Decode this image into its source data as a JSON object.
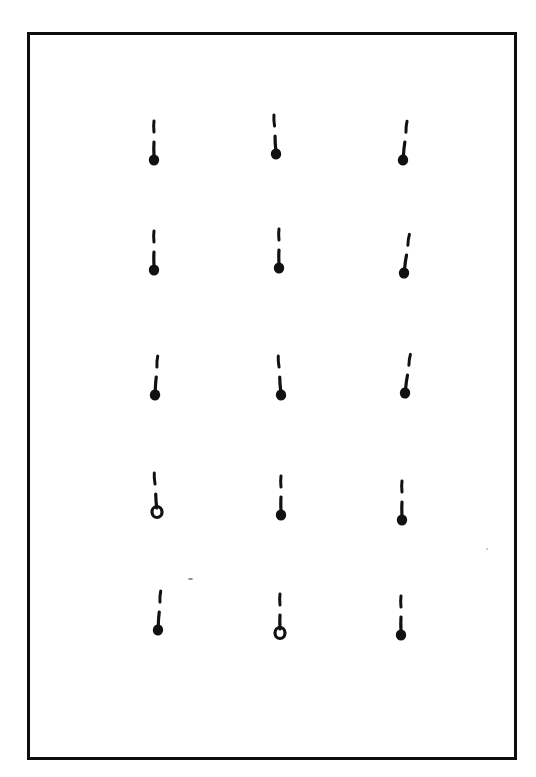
{
  "figure": {
    "frame": {
      "left": 27,
      "top": 32,
      "right": 514,
      "bottom": 757,
      "stroke_color": "#111111"
    },
    "ink_color": "#111111",
    "background": "#ffffff",
    "grid": {
      "columns": 3,
      "rows": 5,
      "column_x": [
        154,
        277,
        402
      ],
      "row_y": [
        120,
        230,
        352,
        472,
        590
      ]
    },
    "marks": [
      {
        "row": 0,
        "col": 0,
        "x": 154,
        "y": 120,
        "tilt": 0,
        "blob": "filled"
      },
      {
        "row": 0,
        "col": 1,
        "x": 276,
        "y": 114,
        "tilt": -3,
        "blob": "filled"
      },
      {
        "row": 0,
        "col": 2,
        "x": 403,
        "y": 120,
        "tilt": 6,
        "blob": "filled"
      },
      {
        "row": 1,
        "col": 0,
        "x": 154,
        "y": 230,
        "tilt": 0,
        "blob": "filled"
      },
      {
        "row": 1,
        "col": 1,
        "x": 279,
        "y": 228,
        "tilt": 0,
        "blob": "filled"
      },
      {
        "row": 1,
        "col": 2,
        "x": 404,
        "y": 233,
        "tilt": 8,
        "blob": "filled"
      },
      {
        "row": 2,
        "col": 0,
        "x": 155,
        "y": 355,
        "tilt": 4,
        "blob": "filled"
      },
      {
        "row": 2,
        "col": 1,
        "x": 281,
        "y": 355,
        "tilt": -4,
        "blob": "filled"
      },
      {
        "row": 2,
        "col": 2,
        "x": 405,
        "y": 353,
        "tilt": 8,
        "blob": "filled"
      },
      {
        "row": 3,
        "col": 0,
        "x": 157,
        "y": 472,
        "tilt": -4,
        "blob": "ring"
      },
      {
        "row": 3,
        "col": 1,
        "x": 281,
        "y": 475,
        "tilt": 0,
        "blob": "filled"
      },
      {
        "row": 3,
        "col": 2,
        "x": 402,
        "y": 480,
        "tilt": 0,
        "blob": "filled"
      },
      {
        "row": 4,
        "col": 0,
        "x": 158,
        "y": 590,
        "tilt": 4,
        "blob": "filled"
      },
      {
        "row": 4,
        "col": 1,
        "x": 280,
        "y": 593,
        "tilt": 0,
        "blob": "ring"
      },
      {
        "row": 4,
        "col": 2,
        "x": 401,
        "y": 595,
        "tilt": 0,
        "blob": "filled"
      }
    ]
  }
}
